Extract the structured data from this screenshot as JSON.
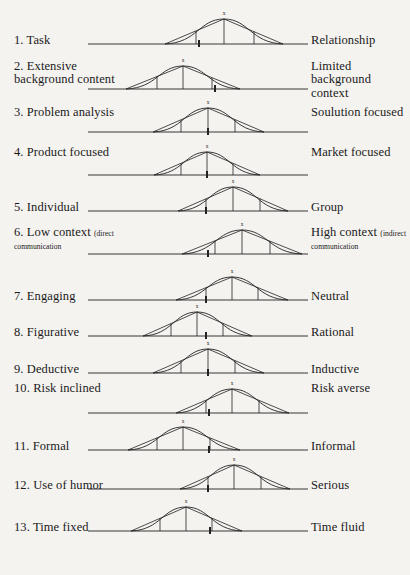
{
  "figure": {
    "type": "bipolar-scale-diagram",
    "background_color": "#f5f3f0",
    "line_color": "#222222",
    "text_color": "#1a1a1a",
    "peak_marker_label": "x",
    "baseline_start_x": 88,
    "baseline_end_x": 308,
    "rows_count": 13
  },
  "rows": [
    {
      "number": "1.",
      "left_label": "1. Task",
      "right_label": "Relationship",
      "left_sub": "",
      "right_sub": "",
      "row_top": 18,
      "baseline_y": 44,
      "curve_left": 165,
      "curve_right": 283,
      "peak_x": 224,
      "peak_height": 25,
      "ticks": [
        196,
        224,
        254
      ],
      "marker_x": 199
    },
    {
      "number": "2.",
      "left_label": "2. Extensive background content",
      "right_label": "Limited background context",
      "left_sub": "",
      "right_sub": "",
      "row_top": 60,
      "baseline_y": 89,
      "curve_left": 126,
      "curve_right": 240,
      "peak_x": 183,
      "peak_height": 23,
      "ticks": [
        157,
        183,
        212
      ],
      "marker_x": 215
    },
    {
      "number": "3.",
      "left_label": "3. Problem analysis",
      "right_label": "Soulution focused",
      "left_sub": "",
      "right_sub": "",
      "row_top": 106,
      "baseline_y": 132,
      "curve_left": 153,
      "curve_right": 264,
      "peak_x": 208,
      "peak_height": 24,
      "ticks": [
        181,
        208,
        235
      ],
      "marker_x": 208
    },
    {
      "number": "4.",
      "left_label": "4. Product focused",
      "right_label": "Market focused",
      "left_sub": "",
      "right_sub": "",
      "row_top": 146,
      "baseline_y": 175,
      "curve_left": 154,
      "curve_right": 260,
      "peak_x": 207,
      "peak_height": 23,
      "ticks": [
        181,
        207,
        233
      ],
      "marker_x": 207
    },
    {
      "number": "5.",
      "left_label": "5. Individual",
      "right_label": "Group",
      "left_sub": "",
      "right_sub": "",
      "row_top": 184,
      "baseline_y": 211,
      "curve_left": 178,
      "curve_right": 288,
      "peak_x": 233,
      "peak_height": 24,
      "ticks": [
        206,
        233,
        260
      ],
      "marker_x": 206
    },
    {
      "number": "6.",
      "left_label": "6. Low context",
      "right_label": "High context",
      "left_sub": "(direct communication",
      "right_sub": "(indirect communication",
      "row_top": 226,
      "baseline_y": 254,
      "curve_left": 182,
      "curve_right": 302,
      "peak_x": 242,
      "peak_height": 24,
      "ticks": [
        215,
        242,
        270
      ],
      "marker_x": 208
    },
    {
      "number": "7.",
      "left_label": "7. Engaging",
      "right_label": "Neutral",
      "left_sub": "",
      "right_sub": "",
      "row_top": 272,
      "baseline_y": 300,
      "curve_left": 176,
      "curve_right": 288,
      "peak_x": 232,
      "peak_height": 23,
      "ticks": [
        206,
        232,
        258
      ],
      "marker_x": 206
    },
    {
      "number": "8.",
      "left_label": "8. Figurative",
      "right_label": "Rational",
      "left_sub": "",
      "right_sub": "",
      "row_top": 308,
      "baseline_y": 336,
      "curve_left": 143,
      "curve_right": 252,
      "peak_x": 197,
      "peak_height": 24,
      "ticks": [
        171,
        197,
        223
      ],
      "marker_x": 206
    },
    {
      "number": "9.",
      "left_label": "9. Deductive",
      "right_label": "Inductive",
      "left_sub": "",
      "right_sub": "",
      "row_top": 345,
      "baseline_y": 373,
      "curve_left": 153,
      "curve_right": 264,
      "peak_x": 208,
      "peak_height": 24,
      "ticks": [
        181,
        208,
        235
      ],
      "marker_x": 208
    },
    {
      "number": "10.",
      "left_label": "10. Risk inclined",
      "right_label": "Risk averse",
      "left_sub": "",
      "right_sub": "",
      "row_top": 382,
      "baseline_y": 413,
      "curve_left": 176,
      "curve_right": 289,
      "peak_x": 232,
      "peak_height": 24,
      "ticks": [
        206,
        232,
        259
      ],
      "marker_x": 209
    },
    {
      "number": "11.",
      "left_label": "11. Formal",
      "right_label": "Informal",
      "left_sub": "",
      "right_sub": "",
      "row_top": 423,
      "baseline_y": 450,
      "curve_left": 128,
      "curve_right": 240,
      "peak_x": 183,
      "peak_height": 23,
      "ticks": [
        157,
        183,
        210
      ],
      "marker_x": 209
    },
    {
      "number": "12.",
      "left_label": "12. Use of humor",
      "right_label": "Serious",
      "left_sub": "",
      "right_sub": "",
      "row_top": 459,
      "baseline_y": 489,
      "curve_left": 180,
      "curve_right": 290,
      "peak_x": 234,
      "peak_height": 24,
      "ticks": [
        208,
        234,
        261
      ],
      "marker_x": 208
    },
    {
      "number": "13.",
      "left_label": "13. Time fixed",
      "right_label": "Time fluid",
      "left_sub": "",
      "right_sub": "",
      "row_top": 500,
      "baseline_y": 531,
      "curve_left": 131,
      "curve_right": 242,
      "peak_x": 186,
      "peak_height": 24,
      "ticks": [
        160,
        186,
        212
      ],
      "marker_x": 210
    }
  ]
}
